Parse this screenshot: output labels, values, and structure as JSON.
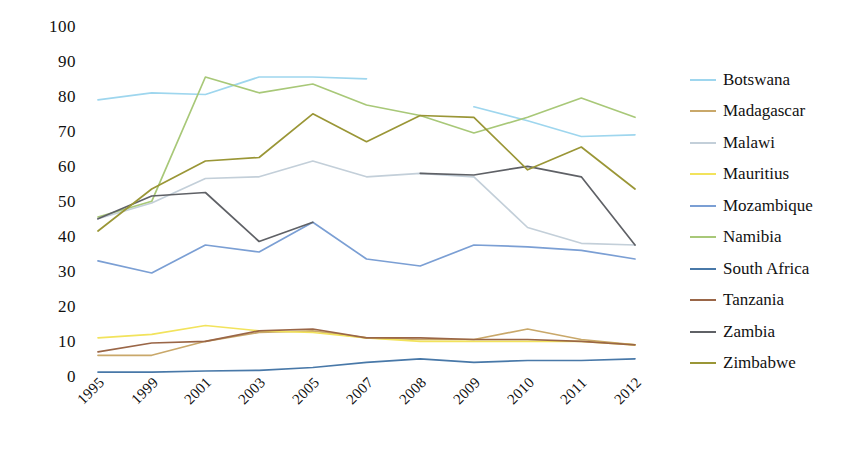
{
  "chart_data": {
    "type": "line",
    "title": "",
    "xlabel": "",
    "ylabel": "",
    "categories": [
      "1995",
      "1999",
      "2001",
      "2003",
      "2005",
      "2007",
      "2008",
      "2009",
      "2010",
      "2011",
      "2012"
    ],
    "ylim": [
      0,
      100
    ],
    "ytick_values": [
      0,
      10,
      20,
      30,
      40,
      50,
      60,
      70,
      80,
      90,
      100
    ],
    "grid": false,
    "legend_position": "right",
    "series": [
      {
        "name": "Botswana",
        "color": "#9ed6ee",
        "values": [
          79.5,
          81.5,
          81,
          86,
          86,
          85.5,
          null,
          77.5,
          73.5,
          69,
          69.5
        ]
      },
      {
        "name": "Madagascar",
        "color": "#c9a86a",
        "values": [
          6.5,
          6.5,
          10.5,
          13,
          13.5,
          11.5,
          11,
          11,
          14,
          11,
          9.5
        ]
      },
      {
        "name": "Malawi",
        "color": "#c3cfd9",
        "values": [
          45.5,
          50,
          57,
          57.5,
          62,
          57.5,
          58.5,
          57.5,
          43,
          38.5,
          38
        ]
      },
      {
        "name": "Mauritius",
        "color": "#f2e35c",
        "values": [
          11.5,
          12.5,
          15,
          13.5,
          13,
          11.5,
          10.5,
          10.5,
          10.5,
          10.5,
          9.5
        ]
      },
      {
        "name": "Mozambique",
        "color": "#7b9fd4",
        "values": [
          33.5,
          30,
          38,
          36,
          44.5,
          34,
          32,
          38,
          37.5,
          36.5,
          34
        ]
      },
      {
        "name": "Namibia",
        "color": "#a8c878",
        "values": [
          46,
          50.5,
          86,
          81.5,
          84,
          78,
          75,
          70,
          74.5,
          80,
          74.5
        ]
      },
      {
        "name": "South Africa",
        "color": "#4878a8",
        "values": [
          1.7,
          1.7,
          2,
          2.2,
          3,
          4.5,
          5.5,
          4.5,
          5,
          5,
          5.5
        ]
      },
      {
        "name": "Tanzania",
        "color": "#9a6647",
        "values": [
          7.5,
          10,
          10.5,
          13.5,
          14,
          11.5,
          11.5,
          11,
          11,
          10.5,
          9.5
        ]
      },
      {
        "name": "Zambia",
        "color": "#5f6166",
        "values": [
          45.5,
          52,
          53,
          39,
          44.5,
          null,
          58.5,
          58,
          60.5,
          57.5,
          38
        ]
      },
      {
        "name": "Zimbabwe",
        "color": "#9a9636",
        "values": [
          42,
          54,
          62,
          63,
          75.5,
          67.5,
          75,
          74.5,
          59.5,
          66,
          54
        ]
      }
    ]
  },
  "legend": {
    "items": [
      {
        "label": "Botswana"
      },
      {
        "label": "Madagascar"
      },
      {
        "label": "Malawi"
      },
      {
        "label": "Mauritius"
      },
      {
        "label": "Mozambique"
      },
      {
        "label": "Namibia"
      },
      {
        "label": "South Africa"
      },
      {
        "label": "Tanzania"
      },
      {
        "label": "Zambia"
      },
      {
        "label": "Zimbabwe"
      }
    ]
  }
}
